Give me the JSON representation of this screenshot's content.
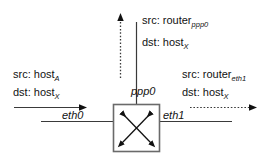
{
  "diagram": {
    "router": {
      "name": "router-box",
      "glyph": "crossed-bidirectional-arrows"
    },
    "interfaces": [
      {
        "id": "eth0",
        "label": "eth0",
        "position": "left"
      },
      {
        "id": "eth1",
        "label": "eth1",
        "position": "right"
      },
      {
        "id": "ppp0",
        "label": "ppp0",
        "position": "top"
      }
    ],
    "packets": [
      {
        "id": "incoming-eth0",
        "src_prefix": "src:",
        "src_value": "host",
        "src_subscript": "A",
        "dst_prefix": "dst:",
        "dst_value": "host",
        "dst_subscript": "X",
        "arrow": "solid",
        "direction": "right"
      },
      {
        "id": "outgoing-ppp0",
        "src_prefix": "src:",
        "src_value": "router",
        "src_subscript": "ppp0",
        "dst_prefix": "dst:",
        "dst_value": "host",
        "dst_subscript": "X",
        "arrow": "dotted",
        "direction": "up"
      },
      {
        "id": "outgoing-eth1",
        "src_prefix": "src:",
        "src_value": "router",
        "src_subscript": "eth1",
        "dst_prefix": "dst:",
        "dst_value": "host",
        "dst_subscript": "X",
        "arrow": "dotted",
        "direction": "right"
      }
    ],
    "colors": {
      "stroke": "#3a3a3a",
      "box_stroke": "#555555",
      "arrow_fill": "#111111",
      "text": "#111111",
      "background": "#ffffff"
    }
  }
}
